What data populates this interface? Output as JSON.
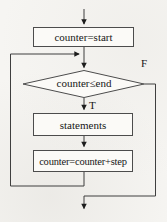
{
  "diagram": {
    "type": "flowchart",
    "nodes": [
      {
        "id": "init",
        "shape": "rectangle",
        "label": "counter=start"
      },
      {
        "id": "condition",
        "shape": "diamond",
        "label": "counter≤end"
      },
      {
        "id": "body",
        "shape": "rectangle",
        "label": "statements"
      },
      {
        "id": "increment",
        "shape": "rectangle",
        "label": "counter=counter+step"
      }
    ],
    "branch_labels": {
      "true": "T",
      "false": "F"
    },
    "edges": [
      {
        "from": "entry",
        "to": "init"
      },
      {
        "from": "init",
        "to": "condition"
      },
      {
        "from": "condition",
        "to": "body",
        "label": "T"
      },
      {
        "from": "body",
        "to": "increment"
      },
      {
        "from": "increment",
        "to": "condition",
        "label": ""
      },
      {
        "from": "condition",
        "to": "exit",
        "label": "F"
      }
    ],
    "colors": {
      "line": "#3f3f3f",
      "arrowhead": "#1c1c1c",
      "node_border": "#4c4c4c",
      "node_fill": "#fbfaf7",
      "background": "#f6f5f2",
      "text": "#161616"
    }
  }
}
